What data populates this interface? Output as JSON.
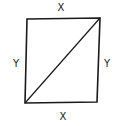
{
  "diagram": {
    "type": "quadrilateral-with-diagonal",
    "stroke_color": "#1a1a1a",
    "vertices": {
      "top_left": [
        27,
        19
      ],
      "top_right": [
        100,
        18
      ],
      "bottom_right": [
        97,
        102
      ],
      "bottom_left": [
        25,
        103
      ]
    },
    "diagonal": {
      "from": "bottom_left",
      "to": "top_right"
    },
    "labels": {
      "top": "X",
      "bottom": "X",
      "left": "Y",
      "right": "Y"
    }
  }
}
